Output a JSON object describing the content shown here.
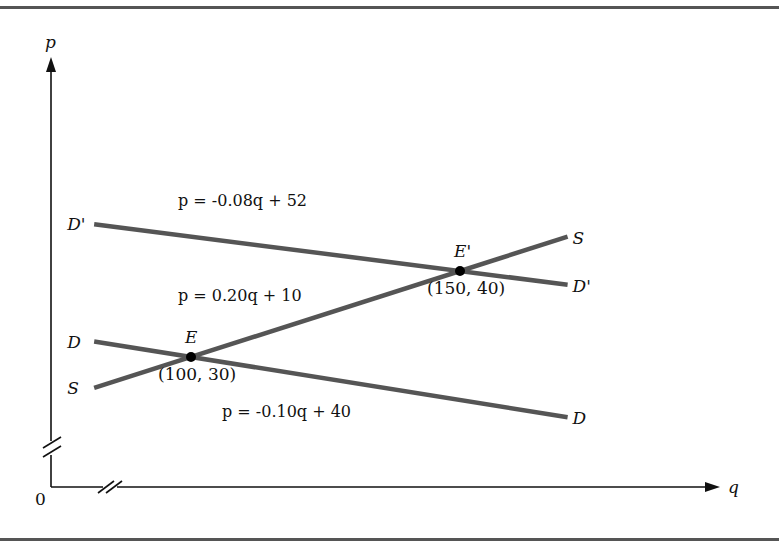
{
  "chart_data": {
    "type": "line",
    "title": "",
    "xlabel": "q",
    "ylabel": "p",
    "origin_label": "0",
    "axis_breaks": {
      "x": true,
      "y": true
    },
    "grid": false,
    "legend": "none",
    "series": [
      {
        "name": "D'",
        "kind": "demand-shifted",
        "equation": "p = -0.08q + 52",
        "slope": -0.08,
        "intercept": 52,
        "q_range": [
          82,
          170
        ],
        "end_labels": [
          "D'",
          "D'"
        ]
      },
      {
        "name": "D",
        "kind": "demand",
        "equation": "p = -0.10q + 40",
        "slope": -0.1,
        "intercept": 40,
        "q_range": [
          82,
          170
        ],
        "end_labels": [
          "D",
          "D"
        ]
      },
      {
        "name": "S",
        "kind": "supply",
        "equation": "p = 0.20q + 10",
        "slope": 0.2,
        "intercept": 10,
        "q_range": [
          82,
          170
        ],
        "end_labels": [
          "S",
          "S"
        ]
      }
    ],
    "points": [
      {
        "name": "E",
        "q": 100,
        "p": 30,
        "label": "E",
        "coord_label": "(100, 30)"
      },
      {
        "name": "E'",
        "q": 150,
        "p": 40,
        "label": "E'",
        "coord_label": "(150, 40)"
      }
    ],
    "equation_labels": {
      "d_prime": "p = -0.08q + 52",
      "s": "p = 0.20q + 10",
      "d": "p = -0.10q + 40"
    }
  }
}
